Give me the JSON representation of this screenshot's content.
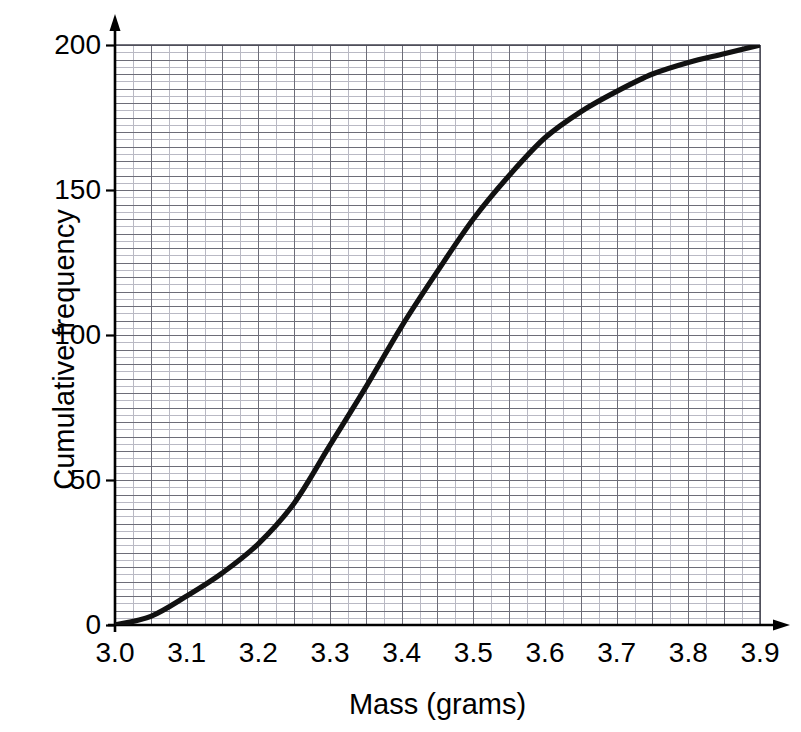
{
  "chart_data": {
    "type": "line",
    "title": "",
    "subtitle": "",
    "xlabel": "Mass (grams)",
    "ylabel": "Cumulative frequency",
    "xlim": [
      3.0,
      3.9
    ],
    "ylim": [
      0,
      200
    ],
    "grid": true,
    "grid_major_x_step": 0.05,
    "grid_major_y_step": 5,
    "grid_minor_x_step": 0.025,
    "grid_minor_y_step": 2.5,
    "legend": null,
    "legend_position": "none",
    "xticks": [
      "3.0",
      "3.1",
      "3.2",
      "3.3",
      "3.4",
      "3.5",
      "3.6",
      "3.7",
      "3.8",
      "3.9"
    ],
    "xtick_values": [
      3.0,
      3.1,
      3.2,
      3.3,
      3.4,
      3.5,
      3.6,
      3.7,
      3.8,
      3.9
    ],
    "yticks": [
      "0",
      "50",
      "100",
      "150",
      "200"
    ],
    "ytick_values": [
      0,
      50,
      100,
      150,
      200
    ],
    "series": [
      {
        "name": "Cumulative frequency",
        "color": "#111111",
        "x": [
          3.0,
          3.05,
          3.1,
          3.15,
          3.2,
          3.25,
          3.3,
          3.35,
          3.4,
          3.45,
          3.5,
          3.55,
          3.6,
          3.65,
          3.7,
          3.75,
          3.8,
          3.85,
          3.9
        ],
        "values": [
          0,
          3,
          10,
          18,
          28,
          42,
          62,
          82,
          103,
          122,
          140,
          155,
          168,
          177,
          184,
          190,
          194,
          197,
          200
        ]
      }
    ],
    "annotations": []
  },
  "axes": {
    "x_title": "Mass (grams)",
    "y_title": "Cumulative frequency"
  },
  "colors": {
    "curve": "#111111",
    "axis": "#000000",
    "grid_major": "#6d6d78",
    "grid_minor": "#b9b9c4",
    "background": "#ffffff"
  }
}
